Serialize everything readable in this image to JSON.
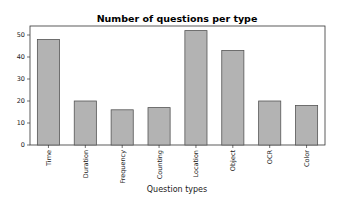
{
  "chart_data": {
    "type": "bar",
    "title": "Number of questions per type",
    "xlabel": "Question types",
    "ylabel": "",
    "categories": [
      "Time",
      "Duration",
      "Frequency",
      "Counting",
      "Location",
      "Object",
      "OCR",
      "Color"
    ],
    "values": [
      48,
      20,
      16,
      17,
      52,
      43,
      20,
      18
    ],
    "ylim": [
      0,
      55
    ],
    "yticks": [
      0,
      10,
      20,
      30,
      40,
      50
    ],
    "grid": false,
    "legend": null,
    "bar_color": "#b3b3b3",
    "bar_edge_color": "#555555",
    "x_tick_rotation": 90
  }
}
